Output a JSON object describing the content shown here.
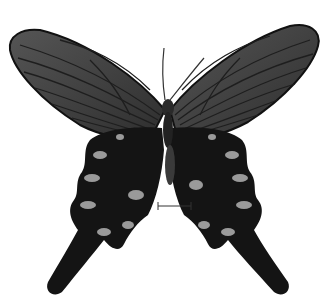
{
  "image": {
    "subject": "swallowtail butterfly specimen, dorsal view",
    "background": "#ffffff",
    "colors": {
      "forewing": "#4a4a4a",
      "forewing_veins": "#1e1e1e",
      "hindwing": "#141414",
      "spots": "#9a9a9a",
      "body": "#2a2a2a",
      "scale_bar": "#333333"
    },
    "scale_bar": {
      "x1": 158,
      "x2": 191,
      "y": 206
    }
  }
}
